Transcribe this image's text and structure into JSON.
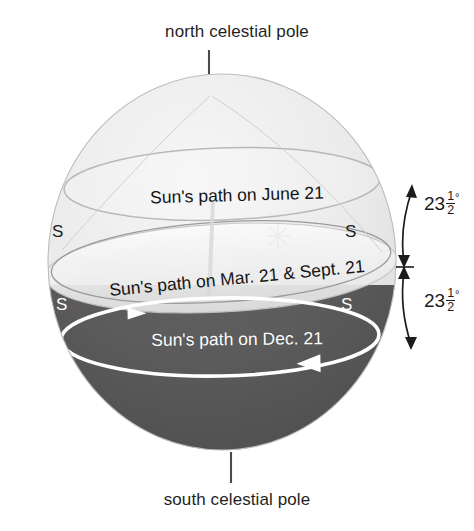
{
  "diagram": {
    "title_top": "north celestial pole",
    "title_bottom": "south celestial pole",
    "paths": {
      "summer": "Sun's path on June 21",
      "equinox": "Sun's path on Mar. 21 & Sept. 21",
      "winter": "Sun's path on Dec. 21"
    },
    "horizon_markers": {
      "upper_left": "S",
      "upper_right": "S",
      "lower_left": "S",
      "lower_right": "S"
    },
    "angles": {
      "upper": {
        "whole": "23",
        "numerator": "1",
        "denominator": "2",
        "unit": "°"
      },
      "lower": {
        "whole": "23",
        "numerator": "1",
        "denominator": "2",
        "unit": "°"
      }
    },
    "colors": {
      "sphere_light": "#e8e8e8",
      "sphere_dark": "#5c5c5c",
      "horizon_plane": "#f2f2f2",
      "outline": "#7a7a7a",
      "text_dark": "#1a1a1a",
      "text_light": "#ffffff",
      "annotation": "#1c1c1c"
    }
  }
}
